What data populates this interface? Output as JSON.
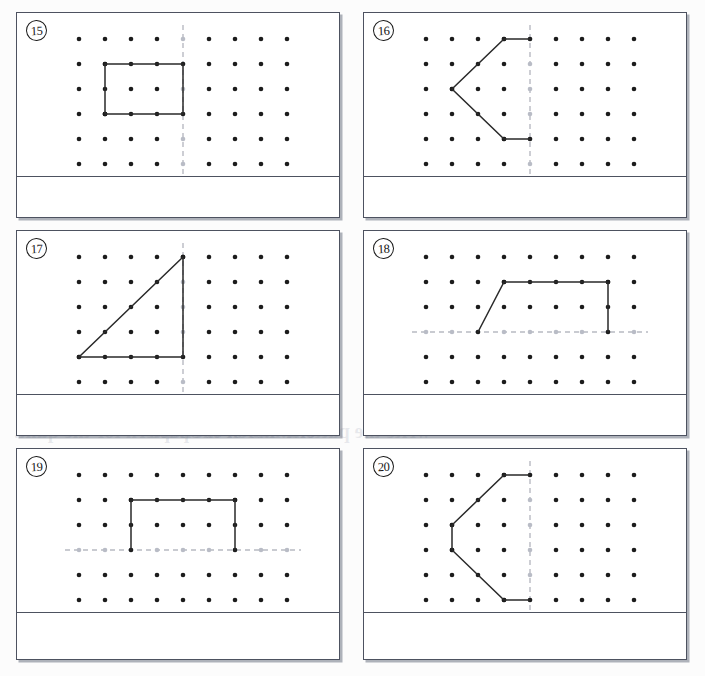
{
  "document": {
    "kind": "worksheet-page",
    "description": "Symmetry geoboard worksheet, problems 15 through 20",
    "page_width": 705,
    "page_height": 676
  },
  "colors": {
    "page_background": "#fcfcfc",
    "panel_background": "#ffffff",
    "panel_border": "#4d5260",
    "panel_shadow": "rgba(110,116,132,0.55)",
    "dot": "#1c1c1c",
    "dot_faint": "#b9bcc6",
    "shape_stroke": "#2a2a2a",
    "mirror_line": "#b8bac2",
    "number_text": "#141414",
    "ghost_text": "rgba(120,128,150,0.16)"
  },
  "grid": {
    "columns": 9,
    "rows": 6,
    "dot_radius": 2.3,
    "origin_x": 62,
    "origin_y": 26,
    "step_x": 26,
    "step_y": 25
  },
  "ghost_text_lines": [
    {
      "text": "the pattern for the",
      "x": 24,
      "y": 52,
      "size": 22
    },
    {
      "text": "and then draw the",
      "x": 30,
      "y": 86,
      "size": 22
    },
    {
      "text": "line of symmetry for each shape.",
      "x": 18,
      "y": 195,
      "size": 17
    },
    {
      "text": "the other half of the shape",
      "x": 392,
      "y": 120,
      "size": 19
    },
    {
      "text": "Draw the other half",
      "x": 398,
      "y": 160,
      "size": 17
    },
    {
      "text": "one half of the pattern for the quilt.",
      "x": 14,
      "y": 420,
      "size": 20
    },
    {
      "text": "write the pattern. Block or shape",
      "x": 150,
      "y": 420,
      "size": 20
    },
    {
      "text": "Complete the drawing",
      "x": 420,
      "y": 300,
      "size": 18
    },
    {
      "text": "Finish the picture so",
      "x": 410,
      "y": 334,
      "size": 16
    }
  ],
  "panels": [
    {
      "id": "panel-15",
      "number_label": "15",
      "x": 16,
      "y": 12,
      "width": 324,
      "height": 206,
      "grid_top_offset": 10,
      "answer_rule_y": 163,
      "mirror_line": {
        "type": "vertical",
        "at": 4
      },
      "shape": {
        "type": "polyline",
        "closed": false,
        "points": [
          [
            1,
            3
          ],
          [
            1,
            1
          ],
          [
            4,
            1
          ],
          [
            4,
            3
          ],
          [
            1,
            3
          ]
        ],
        "description": "rectangle from column 1 to the vertical mirror line at column 4, rows 1 to 3"
      }
    },
    {
      "id": "panel-16",
      "number_label": "16",
      "x": 363,
      "y": 12,
      "width": 324,
      "height": 206,
      "grid_top_offset": 10,
      "answer_rule_y": 163,
      "mirror_line": {
        "type": "vertical",
        "at": 4
      },
      "shape": {
        "type": "polyline",
        "closed": false,
        "points": [
          [
            4,
            0
          ],
          [
            3,
            0
          ],
          [
            1,
            2
          ],
          [
            3,
            4
          ],
          [
            4,
            4
          ]
        ],
        "description": "left-pointing chevron half, touching the vertical mirror line at top and bottom"
      }
    },
    {
      "id": "panel-17",
      "number_label": "17",
      "x": 16,
      "y": 230,
      "width": 324,
      "height": 206,
      "grid_top_offset": 10,
      "answer_rule_y": 163,
      "mirror_line": {
        "type": "vertical",
        "at": 4
      },
      "shape": {
        "type": "polyline",
        "closed": false,
        "points": [
          [
            4,
            0
          ],
          [
            0,
            4
          ],
          [
            4,
            4
          ],
          [
            4,
            0
          ]
        ],
        "description": "right triangle with hypotenuse rising to the vertical mirror line at column 4"
      }
    },
    {
      "id": "panel-18",
      "number_label": "18",
      "x": 363,
      "y": 230,
      "width": 324,
      "height": 206,
      "grid_top_offset": 10,
      "answer_rule_y": 163,
      "mirror_line": {
        "type": "horizontal",
        "at": 3
      },
      "shape": {
        "type": "polyline",
        "closed": false,
        "points": [
          [
            2,
            3
          ],
          [
            3,
            1
          ],
          [
            7,
            1
          ],
          [
            7,
            3
          ]
        ],
        "description": "trapezoid half sitting on the horizontal mirror line at row 3"
      }
    },
    {
      "id": "panel-19",
      "number_label": "19",
      "x": 16,
      "y": 448,
      "width": 324,
      "height": 212,
      "grid_top_offset": 10,
      "answer_rule_y": 163,
      "mirror_line": {
        "type": "horizontal",
        "at": 3
      },
      "shape": {
        "type": "polyline",
        "closed": false,
        "points": [
          [
            2,
            3
          ],
          [
            2,
            1
          ],
          [
            6,
            1
          ],
          [
            6,
            3
          ]
        ],
        "description": "rectangle half standing on the horizontal mirror line at row 3"
      }
    },
    {
      "id": "panel-20",
      "number_label": "20",
      "x": 363,
      "y": 448,
      "width": 324,
      "height": 212,
      "grid_top_offset": 10,
      "answer_rule_y": 163,
      "mirror_line": {
        "type": "vertical",
        "at": 4
      },
      "shape": {
        "type": "polyline",
        "closed": false,
        "points": [
          [
            4,
            0
          ],
          [
            3,
            0
          ],
          [
            1,
            2
          ],
          [
            1,
            3
          ],
          [
            3,
            5
          ],
          [
            4,
            5
          ]
        ],
        "description": "hexagon half touching the vertical mirror line at column 4"
      }
    }
  ]
}
